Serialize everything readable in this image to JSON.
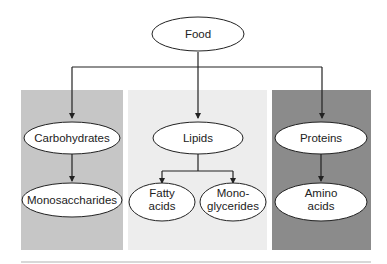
{
  "diagram": {
    "root": {
      "label": "Food"
    },
    "colors": {
      "carbohydrates_panel": "#c6c6c6",
      "lipids_panel": "#ededed",
      "proteins_panel": "#8b8b8b",
      "line": "#222222",
      "node_fill": "#ffffff"
    },
    "branches": [
      {
        "label": "Carbohydrates",
        "children": [
          {
            "line1": "Monosaccharides",
            "line2": ""
          }
        ]
      },
      {
        "label": "Lipids",
        "children": [
          {
            "line1": "Fatty",
            "line2": "acids"
          },
          {
            "line1": "Mono-",
            "line2": "glycerides"
          }
        ]
      },
      {
        "label": "Proteins",
        "children": [
          {
            "line1": "Amino",
            "line2": "acids"
          }
        ]
      }
    ]
  }
}
